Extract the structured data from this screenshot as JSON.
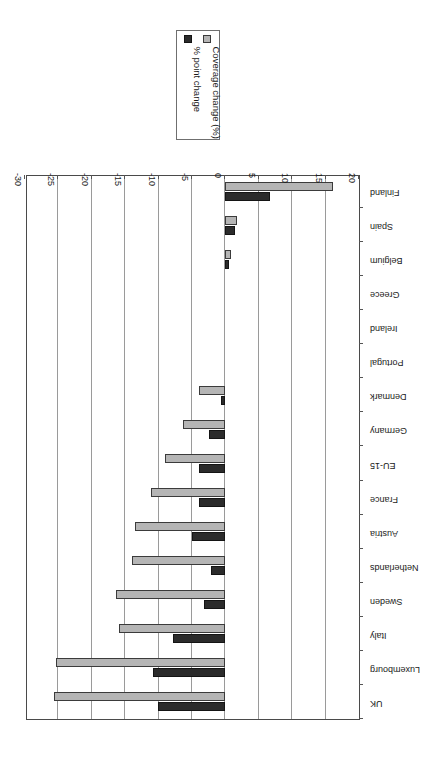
{
  "chart_data": {
    "type": "bar",
    "orientation": "horizontal",
    "title": "",
    "subtitle": "",
    "xlabel": "",
    "ylabel": "",
    "xlim": [
      20,
      -30
    ],
    "grid": true,
    "legend_position": "outside-right",
    "axis_ticks": [
      "20",
      "15",
      "10",
      "5",
      "0",
      "-5",
      "-10",
      "-15",
      "-20",
      "-25",
      "-30"
    ],
    "axis_tick_values": [
      20,
      15,
      10,
      5,
      0,
      -5,
      -10,
      -15,
      -20,
      -25,
      -30
    ],
    "categories": [
      "Finland",
      "Spain",
      "Belgium",
      "Greece",
      "Ireland",
      "Portugal",
      "Denmark",
      "Germany",
      "EU-15",
      "France",
      "Austria",
      "Netherlands",
      "Sweden",
      "Italy",
      "Luxembourg",
      "UK"
    ],
    "series": [
      {
        "name": "Coverage change (%)",
        "color": "#b5b5b5",
        "values": [
          16.1,
          1.8,
          0.8,
          0.0,
          0.0,
          0.0,
          -4.0,
          -6.4,
          -9.0,
          -11.1,
          -13.6,
          -14.0,
          -16.4,
          -16.0,
          -25.3,
          -25.7
        ]
      },
      {
        "name": "% point change",
        "color": "#2b2b2b",
        "values": [
          6.7,
          1.4,
          0.6,
          0.0,
          0.0,
          0.0,
          -0.7,
          -2.5,
          -4.0,
          -4.0,
          -5.0,
          -2.2,
          -3.2,
          -7.9,
          -10.9,
          -10.1
        ]
      }
    ]
  },
  "legend": {
    "items": [
      {
        "label": "Coverage change (%)",
        "swatch": "light"
      },
      {
        "label": "% point change",
        "swatch": "dark"
      }
    ]
  }
}
